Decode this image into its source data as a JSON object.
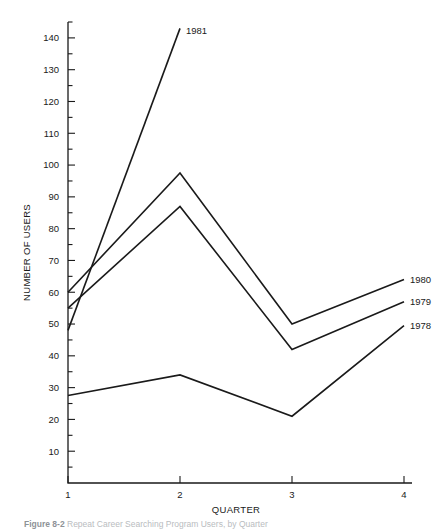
{
  "figure": {
    "caption_bold": "Figure 8-2",
    "caption_rest": "Repeat Career Searching Program Users, by Quarter"
  },
  "chart_data": {
    "type": "line",
    "title": "",
    "xlabel": "QUARTER",
    "ylabel": "NUMBER OF USERS",
    "x": [
      1,
      2,
      3,
      4
    ],
    "xticklabels": [
      "1",
      "2",
      "3",
      "4"
    ],
    "xlim": [
      1,
      4
    ],
    "ylim": [
      0,
      145
    ],
    "yticks": [
      10,
      20,
      30,
      40,
      50,
      60,
      70,
      80,
      90,
      100,
      110,
      120,
      130,
      140
    ],
    "yticklabels": [
      "10",
      "20",
      "30",
      "40",
      "50",
      "60",
      "70",
      "80",
      "90",
      "100",
      "110",
      "120",
      "130",
      "140"
    ],
    "yminorticks": [
      5,
      15,
      25,
      35,
      45,
      55,
      65,
      75,
      85,
      95,
      105,
      115,
      125,
      135,
      145
    ],
    "grid": false,
    "legend": "inline-end-labels",
    "series": [
      {
        "name": "1981",
        "label": "1981",
        "x": [
          1,
          2
        ],
        "values": [
          48,
          143
        ],
        "label_pos": "top"
      },
      {
        "name": "1980",
        "label": "1980",
        "x": [
          1,
          2,
          3,
          4
        ],
        "values": [
          60,
          97.5,
          50,
          64
        ],
        "label_pos": "right"
      },
      {
        "name": "1979",
        "label": "1979",
        "x": [
          1,
          2,
          3,
          4
        ],
        "values": [
          55,
          87,
          42,
          57
        ],
        "label_pos": "right"
      },
      {
        "name": "1978",
        "label": "1978",
        "x": [
          1,
          2,
          3,
          4
        ],
        "values": [
          27.5,
          34,
          21,
          49.5
        ],
        "label_pos": "right"
      }
    ]
  },
  "colors": {
    "ink": "#1a1a1a",
    "background": "#ffffff",
    "caption": "#b9bcc0"
  }
}
